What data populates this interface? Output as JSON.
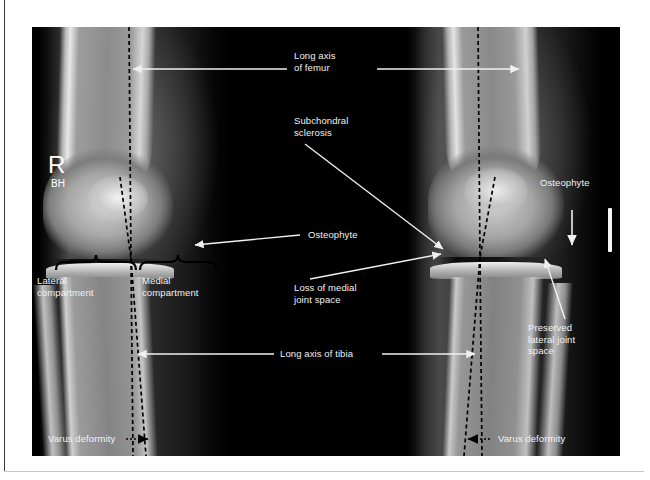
{
  "figure": {
    "modality": "radiograph",
    "view": "bilateral standing knee AP",
    "side_marker": "R",
    "technologist_initials": "BH"
  },
  "annotations": {
    "long_axis_femur": "Long axis\nof femur",
    "subchondral_sclerosis": "Subchondral\nsclerosis",
    "osteophyte_left": "Osteophyte",
    "osteophyte_right": "Osteophyte",
    "loss_of_medial_joint_space": "Loss of medial\njoint space",
    "preserved_lateral_joint_space": "Preserved\nlateral joint\nspace",
    "lateral_compartment": "Lateral\ncompartment",
    "medial_compartment": "Medial\ncompartment",
    "long_axis_tibia": "Long axis of tibia",
    "varus_deformity_left": "Varus deformity",
    "varus_deformity_right": "Varus deformity"
  },
  "colors": {
    "annotation_text": "#f2f2f2",
    "arrow": "#f0f0f0",
    "axis_line": "#000000",
    "brace": "#000000",
    "plate_background": "#000000",
    "page_background": "#ffffff"
  }
}
